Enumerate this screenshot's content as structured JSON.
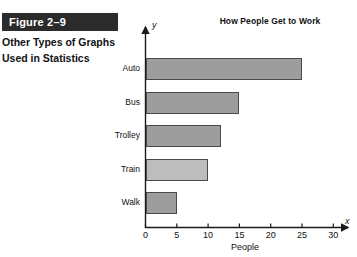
{
  "caption": {
    "figure_banner": "Figure 2–9",
    "lines": [
      "Other Types of Graphs",
      "Used in Statistics"
    ]
  },
  "axis_letters": {
    "y": "y",
    "x": "x"
  },
  "colors": {
    "banner_background": "#2b2b2b",
    "banner_text": "#ffffff",
    "bar_fill": "#9d9d9d",
    "bar_fill_light": "#bdbdbd",
    "bar_border": "#4a4a4a",
    "axis": "#1a1a1a",
    "page_background": "#ffffff"
  },
  "chart_data": {
    "type": "bar",
    "orientation": "horizontal",
    "title": "How People Get to Work",
    "xlabel": "People",
    "ylabel": "",
    "categories": [
      "Auto",
      "Bus",
      "Trolley",
      "Train",
      "Walk"
    ],
    "values": [
      25,
      15,
      12,
      10,
      5
    ],
    "xlim": [
      0,
      30
    ],
    "xticks": [
      0,
      5,
      10,
      15,
      20,
      25,
      30
    ],
    "xtick_labels": [
      "0",
      "5",
      "10",
      "15",
      "20",
      "25",
      "30"
    ],
    "grid": false,
    "legend": null,
    "bar_colors": [
      "#9d9d9d",
      "#9d9d9d",
      "#9d9d9d",
      "#bdbdbd",
      "#9d9d9d"
    ]
  }
}
